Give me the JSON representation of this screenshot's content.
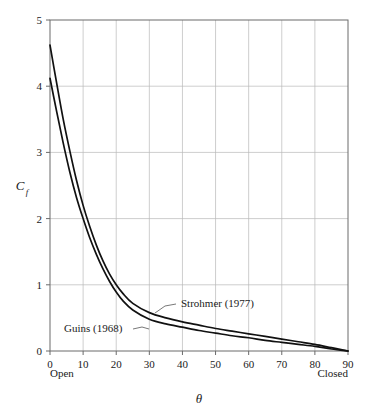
{
  "chart_data": {
    "type": "line",
    "title": "",
    "subtitle": "",
    "xlabel": "θ",
    "ylabel": "C",
    "ylabel_subscript": "f",
    "xlim": [
      0,
      90
    ],
    "ylim": [
      0,
      5
    ],
    "grid": true,
    "legend_position": "inline-annotations",
    "x_ticks": [
      "0",
      "10",
      "20",
      "30",
      "40",
      "50",
      "60",
      "70",
      "80",
      "90"
    ],
    "x_tick_values": [
      0,
      10,
      20,
      30,
      40,
      50,
      60,
      70,
      80,
      90
    ],
    "y_ticks": [
      "0",
      "1",
      "2",
      "3",
      "4",
      "5"
    ],
    "y_tick_values": [
      0,
      1,
      2,
      3,
      4,
      5
    ],
    "x_axis_end_labels": {
      "left": "Open",
      "right": "Closed"
    },
    "x": [
      0,
      2,
      4,
      6,
      8,
      10,
      12,
      14,
      16,
      18,
      20,
      22,
      25,
      30,
      35,
      40,
      45,
      50,
      55,
      60,
      65,
      70,
      75,
      80,
      85,
      90
    ],
    "series": [
      {
        "name": "Strohmer (1977)",
        "label": "Strohmer (1977)",
        "color": "#111111",
        "values": [
          4.62,
          4.05,
          3.5,
          3.02,
          2.58,
          2.2,
          1.88,
          1.6,
          1.36,
          1.16,
          1.0,
          0.87,
          0.72,
          0.58,
          0.5,
          0.44,
          0.39,
          0.34,
          0.3,
          0.26,
          0.22,
          0.18,
          0.14,
          0.1,
          0.05,
          0.0
        ]
      },
      {
        "name": "Guins (1968)",
        "label": "Guins (1968)",
        "color": "#111111",
        "values": [
          4.12,
          3.62,
          3.14,
          2.7,
          2.32,
          2.0,
          1.71,
          1.46,
          1.24,
          1.05,
          0.89,
          0.76,
          0.62,
          0.48,
          0.41,
          0.36,
          0.31,
          0.27,
          0.23,
          0.2,
          0.16,
          0.13,
          0.1,
          0.07,
          0.03,
          0.0
        ]
      }
    ],
    "annotations": [
      {
        "text": "Strohmer (1977)",
        "name": "annotation-strohmer",
        "text_x": 181,
        "text_y": 307,
        "leader": "M 176 304 L 165 306 L 155 313"
      },
      {
        "text": "Guins (1968)",
        "name": "annotation-guins",
        "text_x": 64,
        "text_y": 332,
        "leader": "M 133 329 L 142 327 L 149 329"
      }
    ]
  },
  "plot_geometry": {
    "left": 50,
    "right": 348,
    "top": 20,
    "bottom": 351
  }
}
